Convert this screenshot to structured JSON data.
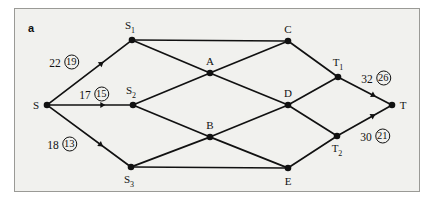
{
  "figure": {
    "panel_label": "a",
    "background": "#f1f1ee",
    "border_color": "#9a9a96",
    "ink_color": "#111111"
  },
  "graph": {
    "nodes": [
      {
        "id": "S",
        "label": "S",
        "x": 47,
        "y": 105,
        "label_dx": -11,
        "label_dy": 0
      },
      {
        "id": "S1",
        "label": "S<sub>1</sub>",
        "x": 132,
        "y": 40,
        "label_dx": -2,
        "label_dy": -13
      },
      {
        "id": "S2",
        "label": "S<sub>2</sub>",
        "x": 133,
        "y": 105,
        "label_dx": -2,
        "label_dy": -13
      },
      {
        "id": "S3",
        "label": "S<sub>3</sub>",
        "x": 131,
        "y": 167,
        "label_dx": -2,
        "label_dy": 14
      },
      {
        "id": "A",
        "label": "A",
        "x": 210,
        "y": 73,
        "label_dx": 0,
        "label_dy": -12
      },
      {
        "id": "B",
        "label": "B",
        "x": 210,
        "y": 137,
        "label_dx": 0,
        "label_dy": -12
      },
      {
        "id": "C",
        "label": "C",
        "x": 288,
        "y": 41,
        "label_dx": 0,
        "label_dy": -12
      },
      {
        "id": "D",
        "label": "D",
        "x": 288,
        "y": 105,
        "label_dx": 0,
        "label_dy": -12
      },
      {
        "id": "E",
        "label": "E",
        "x": 288,
        "y": 168,
        "label_dx": 0,
        "label_dy": 13
      },
      {
        "id": "T1",
        "label": "T<sub>1</sub>",
        "x": 338,
        "y": 77,
        "label_dx": 0,
        "label_dy": -13
      },
      {
        "id": "T2",
        "label": "T<sub>2</sub>",
        "x": 337,
        "y": 136,
        "label_dx": 0,
        "label_dy": 14
      },
      {
        "id": "T",
        "label": "T",
        "x": 392,
        "y": 105,
        "label_dx": 11,
        "label_dy": 0
      }
    ],
    "edges": [
      {
        "from": "S",
        "to": "S1",
        "arrow": true
      },
      {
        "from": "S",
        "to": "S2",
        "arrow": true
      },
      {
        "from": "S",
        "to": "S3",
        "arrow": true
      },
      {
        "from": "S1",
        "to": "C",
        "arrow": false
      },
      {
        "from": "S1",
        "to": "A",
        "arrow": false
      },
      {
        "from": "S2",
        "to": "A",
        "arrow": false
      },
      {
        "from": "S2",
        "to": "B",
        "arrow": false
      },
      {
        "from": "S3",
        "to": "B",
        "arrow": false
      },
      {
        "from": "S3",
        "to": "E",
        "arrow": false
      },
      {
        "from": "A",
        "to": "C",
        "arrow": false
      },
      {
        "from": "A",
        "to": "D",
        "arrow": false
      },
      {
        "from": "B",
        "to": "D",
        "arrow": false
      },
      {
        "from": "B",
        "to": "E",
        "arrow": false
      },
      {
        "from": "C",
        "to": "T1",
        "arrow": false
      },
      {
        "from": "D",
        "to": "T1",
        "arrow": false
      },
      {
        "from": "D",
        "to": "T2",
        "arrow": false
      },
      {
        "from": "E",
        "to": "T2",
        "arrow": false
      },
      {
        "from": "T1",
        "to": "T",
        "arrow": true
      },
      {
        "from": "T2",
        "to": "T",
        "arrow": true
      }
    ],
    "edge_labels": [
      {
        "edge": "S-S1",
        "capacity": "22",
        "flow": "19",
        "x": 64,
        "y": 62
      },
      {
        "edge": "S-S2",
        "capacity": "17",
        "flow": "15",
        "x": 94,
        "y": 94
      },
      {
        "edge": "S-S3",
        "capacity": "18",
        "flow": "13",
        "x": 62,
        "y": 144
      },
      {
        "edge": "T1-T",
        "capacity": "32",
        "flow": "26",
        "x": 376,
        "y": 78
      },
      {
        "edge": "T2-T",
        "capacity": "30",
        "flow": "21",
        "x": 375,
        "y": 136
      }
    ]
  }
}
